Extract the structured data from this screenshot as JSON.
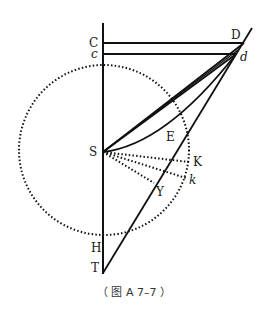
{
  "figure": {
    "caption": "（ 图 A 7–7 ）",
    "labels": {
      "C": "C",
      "c": "c",
      "D": "D",
      "d": "d",
      "S": "S",
      "E": "E",
      "K": "K",
      "k": "k",
      "Y": "Y",
      "H": "H",
      "T": "T"
    },
    "colors": {
      "stroke": "#111111",
      "background": "#ffffff"
    }
  }
}
